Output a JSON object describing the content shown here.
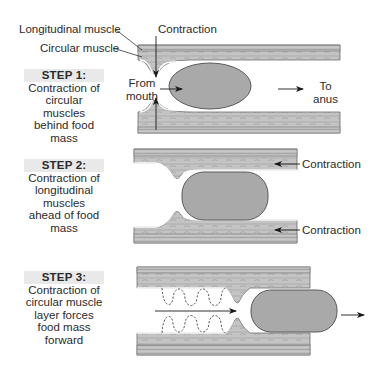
{
  "labels": {
    "longitudinal_muscle": "Longitudinal muscle",
    "circular_muscle": "Circular muscle",
    "contraction_top": "Contraction",
    "from_mouth_line1": "From",
    "from_mouth_line2": "mouth",
    "to_anus_line1": "To",
    "to_anus_line2": "anus",
    "step2_contraction_top": "Contraction",
    "step2_contraction_bottom": "Contraction"
  },
  "steps": [
    {
      "heading": "STEP 1:",
      "lines": [
        "Contraction of",
        "circular muscles",
        "behind food",
        "mass"
      ]
    },
    {
      "heading": "STEP 2:",
      "lines": [
        "Contraction of",
        "longitudinal",
        "muscles",
        "ahead of food",
        "mass"
      ]
    },
    {
      "heading": "STEP 3:",
      "lines": [
        "Contraction of",
        "circular muscle",
        "layer forces",
        "food mass",
        "forward"
      ]
    }
  ],
  "colors": {
    "food_mass": "#a9a9a9",
    "muscle_wall": "#bdbdbd",
    "step_heading_bg": "#e9e9e9",
    "arrow": "#1a1a1a"
  }
}
